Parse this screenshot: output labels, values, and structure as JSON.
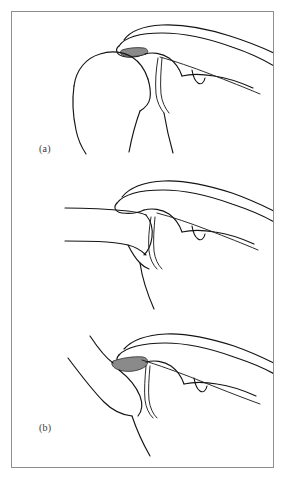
{
  "figure": {
    "type": "anatomical-line-drawing",
    "background_color": "#ffffff",
    "frame_color": "#8e8e8e",
    "line_color": "#141414",
    "shade_color": "#8a8a8a",
    "label_color": "#3a3a3a",
    "panel_count": 3
  },
  "panels": [
    {
      "id": "a",
      "label": "(a)",
      "description": "normal shoulder: rounded humeral head articulating beneath acromion with narrow shaded subacromial space",
      "shaded_region": {
        "present": true,
        "color": "#8a8a8a",
        "size": "narrow",
        "position": "subacromial"
      }
    },
    {
      "id": "b",
      "label": "(b)",
      "description": "flattened humeral head displaced medially, shaded subacromial space absent",
      "shaded_region": {
        "present": false,
        "color": "#8a8a8a",
        "size": "none",
        "position": "subacromial"
      }
    },
    {
      "id": "c",
      "label": "(c)",
      "description": "humeral head rotated and tilted with enlarged wedge shaped shaded defect beneath acromion",
      "shaded_region": {
        "present": true,
        "color": "#8a8a8a",
        "size": "enlarged wedge",
        "position": "subacromial"
      }
    }
  ]
}
